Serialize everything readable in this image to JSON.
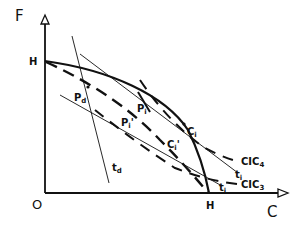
{
  "axes": {
    "y_label": "F",
    "x_label": "C",
    "origin_label": "O",
    "y_intercept_label": "H",
    "x_intercept_label": "H"
  },
  "labels": {
    "pd": {
      "main": "P",
      "sub": "d"
    },
    "td": {
      "main": "t",
      "sub": "d"
    },
    "pi": {
      "main": "P",
      "sub": "i"
    },
    "pi_prime": {
      "main": "P",
      "sub": "i",
      "mark": "'"
    },
    "ci": {
      "main": "C",
      "sub": "i"
    },
    "ci_prime": {
      "main": "C",
      "sub": "i",
      "mark": "'"
    },
    "ti_upper": {
      "main": "t",
      "sub": "i"
    },
    "ti_lower": {
      "main": "t",
      "sub": "i"
    },
    "cic4": {
      "main": "CIC",
      "sub": "4"
    },
    "cic3": {
      "main": "CIC",
      "sub": "3"
    }
  },
  "colors": {
    "ink": "#111111",
    "background": "#ffffff"
  }
}
